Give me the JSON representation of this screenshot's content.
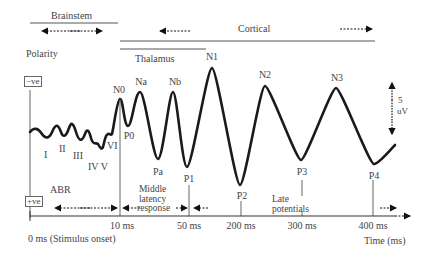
{
  "diagram": {
    "type": "auditory-evoked-potential-waveform",
    "regions": {
      "brainstem": "Brainstem",
      "cortical": "Cortical",
      "thalamus": "Thalamus"
    },
    "polarity": {
      "title": "Polarity",
      "negative": "−ve",
      "positive": "+ve"
    },
    "scale_bar": {
      "value": "5",
      "unit": "uV"
    },
    "components": {
      "abr_waves": [
        "I",
        "II",
        "III",
        "IV V",
        "VI"
      ],
      "N0": "N0",
      "P0": "P0",
      "Na": "Na",
      "Pa": "Pa",
      "Nb": "Nb",
      "P1": "P1",
      "N1": "N1",
      "P2": "P2",
      "N2": "N2",
      "P3": "P3",
      "N3": "N3",
      "P4": "P4"
    },
    "response_labels": {
      "abr": "ABR",
      "mlr_line1": "Middle",
      "mlr_line2": "latency",
      "mlr_line3": "response",
      "late_line1": "Late",
      "late_line2": "potentials"
    },
    "axis": {
      "onset": "0 ms (Stimulus onset)",
      "ticks": [
        "10 ms",
        "50 ms",
        "200 ms",
        "300 ms",
        "400 ms"
      ],
      "title": "Time (ms)"
    },
    "colors": {
      "waveform": "#1a1a1a",
      "lines": "#555555",
      "text": "#444444"
    }
  }
}
